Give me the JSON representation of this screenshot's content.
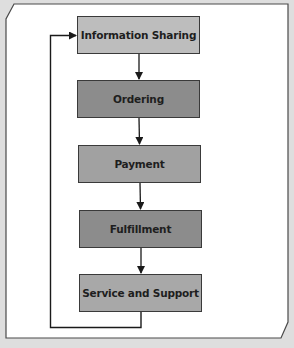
{
  "diagram": {
    "type": "flowchart",
    "direction": "top-to-bottom",
    "nodes": [
      {
        "id": "info",
        "label": "Information Sharing",
        "fill": "#bdbdbd"
      },
      {
        "id": "ordering",
        "label": "Ordering",
        "fill": "#8c8c8c"
      },
      {
        "id": "payment",
        "label": "Payment",
        "fill": "#a1a1a1"
      },
      {
        "id": "fulfillment",
        "label": "Fulfillment",
        "fill": "#8c8c8c"
      },
      {
        "id": "service",
        "label": "Service and Support",
        "fill": "#a8a8a8"
      }
    ],
    "edges": [
      {
        "from": "info",
        "to": "ordering"
      },
      {
        "from": "ordering",
        "to": "payment"
      },
      {
        "from": "payment",
        "to": "fulfillment"
      },
      {
        "from": "fulfillment",
        "to": "service"
      },
      {
        "from": "service",
        "to": "info",
        "type": "feedback-loop"
      }
    ],
    "colors": {
      "background": "#dedede",
      "panel": "#ffffff",
      "border": "#4a4a4a",
      "line": "#1a1a1a"
    }
  }
}
